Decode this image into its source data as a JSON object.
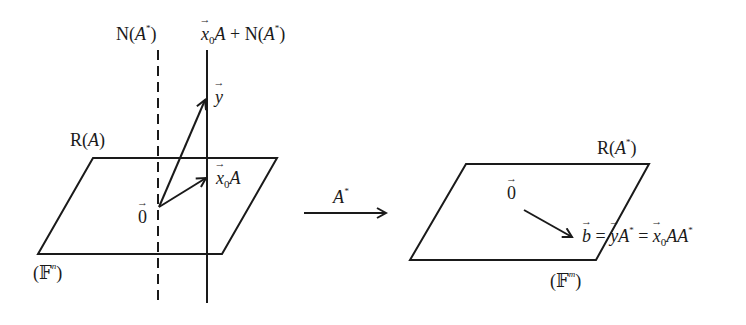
{
  "left": {
    "null_space_label": "N(A*)",
    "affine_line_label": "x0A + N(A*)",
    "y_label": "y",
    "range_label": "R(A)",
    "x0A_label": "x0A",
    "origin_label": "0",
    "space_label": "(F^n)"
  },
  "mapping": {
    "arrow_label": "A*"
  },
  "right": {
    "range_label": "R(A*)",
    "origin_label": "0",
    "equation": "b = yA* = x0AA*",
    "space_label": "(F^m)"
  },
  "colors": {
    "stroke": "#1a1a1a",
    "background": "#ffffff"
  }
}
